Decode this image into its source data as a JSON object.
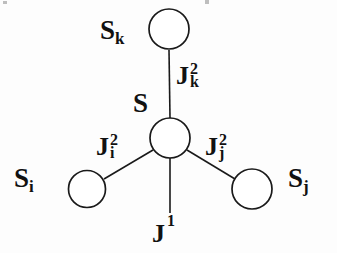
{
  "figure": {
    "background_color": "#fdfdfd",
    "stroke_color": "#1a1a1a",
    "text_color": "#111111"
  },
  "nodes": [
    {
      "id": "center",
      "label_base": "S",
      "label_sub": "",
      "name": "node-s-center",
      "cx": 170,
      "cy": 138,
      "r": 20
    },
    {
      "id": "top",
      "label_base": "S",
      "label_sub": "k",
      "name": "node-s-k",
      "cx": 169,
      "cy": 29,
      "r": 20
    },
    {
      "id": "left",
      "label_base": "S",
      "label_sub": "i",
      "name": "node-s-i",
      "cx": 87,
      "cy": 189,
      "r": 19
    },
    {
      "id": "right",
      "label_base": "S",
      "label_sub": "j",
      "name": "node-s-j",
      "cx": 252,
      "cy": 189,
      "r": 20
    }
  ],
  "node_labels": {
    "center": {
      "base": "S",
      "sub": ""
    },
    "top": {
      "base": "S",
      "sub": "k"
    },
    "left": {
      "base": "S",
      "sub": "i"
    },
    "right": {
      "base": "S",
      "sub": "j"
    }
  },
  "edges": [
    {
      "id": "edge-top",
      "name": "edge-center-to-sk",
      "from": "center",
      "to": "top",
      "x1": 170,
      "y1": 118,
      "x2": 169,
      "y2": 50
    },
    {
      "id": "edge-left",
      "name": "edge-center-to-si",
      "from": "center",
      "to": "left",
      "x1": 153,
      "y1": 150,
      "x2": 104,
      "y2": 179
    },
    {
      "id": "edge-right",
      "name": "edge-center-to-sj",
      "from": "center",
      "to": "right",
      "x1": 187,
      "y1": 150,
      "x2": 235,
      "y2": 179
    },
    {
      "id": "edge-bottom",
      "name": "edge-center-field",
      "from": "center",
      "to": "field",
      "x1": 170,
      "y1": 158,
      "x2": 170,
      "y2": 213
    }
  ],
  "couplings": [
    {
      "id": "J2k",
      "name": "coupling-label-j2k",
      "base": "J",
      "sup": "2",
      "sub": "k",
      "for_edge": "edge-top"
    },
    {
      "id": "J2i",
      "name": "coupling-label-j2i",
      "base": "J",
      "sup": "2",
      "sub": "i",
      "for_edge": "edge-left"
    },
    {
      "id": "J2j",
      "name": "coupling-label-j2j",
      "base": "J",
      "sup": "2",
      "sub": "j",
      "for_edge": "edge-right"
    },
    {
      "id": "J1",
      "name": "coupling-label-j1",
      "base": "J",
      "sup": "1",
      "sub": "",
      "for_edge": "edge-bottom"
    }
  ]
}
